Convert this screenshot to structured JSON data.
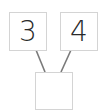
{
  "diagram": {
    "type": "number-bond",
    "parts": [
      {
        "id": "left",
        "value": "3"
      },
      {
        "id": "right",
        "value": "4"
      }
    ],
    "whole": {
      "id": "bottom",
      "value": ""
    },
    "colors": {
      "box_border": "#d4d4d4",
      "connector": "#7a7a7a",
      "text": "#2a2a2a"
    }
  }
}
